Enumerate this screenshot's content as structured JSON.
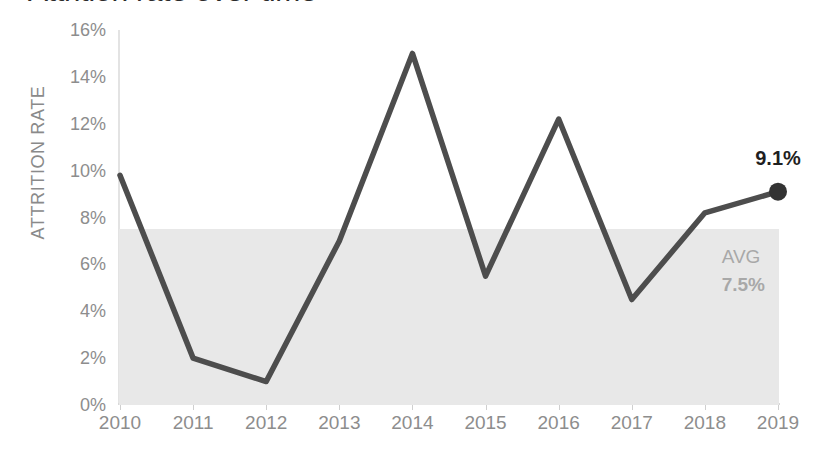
{
  "chart_data": {
    "type": "line",
    "title": "Attrition rate over time",
    "xlabel": "",
    "ylabel": "ATTRITION RATE",
    "categories": [
      "2010",
      "2011",
      "2012",
      "2013",
      "2014",
      "2015",
      "2016",
      "2017",
      "2018",
      "2019"
    ],
    "values": [
      9.8,
      2.0,
      1.0,
      7.0,
      15.0,
      5.5,
      12.2,
      4.5,
      8.2,
      9.1
    ],
    "series": [
      {
        "name": "Attrition rate",
        "values": [
          9.8,
          2.0,
          1.0,
          7.0,
          15.0,
          5.5,
          12.2,
          4.5,
          8.2,
          9.1
        ]
      }
    ],
    "ylim": [
      0,
      16
    ],
    "ytick_values": [
      0,
      2,
      4,
      6,
      8,
      10,
      12,
      14,
      16
    ],
    "ytick_labels": [
      "0%",
      "2%",
      "4%",
      "6%",
      "8%",
      "10%",
      "12%",
      "14%",
      "16%"
    ],
    "grid": false,
    "legend": "none",
    "annotations": [
      {
        "name": "endpoint-value",
        "text": "9.1%",
        "category": "2019",
        "value": 9.1
      },
      {
        "name": "average-band",
        "label": "AVG",
        "value_label": "7.5%",
        "value": 7.5
      }
    ],
    "band": {
      "label": "AVG",
      "value_label": "7.5%",
      "from": 0,
      "to": 7.5
    },
    "marker": {
      "category": "2019",
      "value": 9.1,
      "label": "9.1%"
    },
    "colors": {
      "line": "#4d4d4d",
      "marker": "#333333",
      "band": "#e8e8e8",
      "band_text": "#a8a8a8",
      "axis": "#d8d8d8",
      "tick_text": "#8d8d8d",
      "title": "#2b2b2b",
      "annotation_text": "#1f1f1f",
      "background": "#ffffff"
    }
  }
}
